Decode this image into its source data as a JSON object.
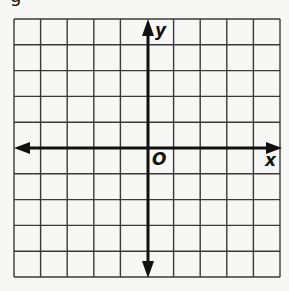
{
  "figure": {
    "x_axis_label": "x",
    "y_axis_label": "y",
    "origin_label": "O",
    "partial_top_left_glyph": "g",
    "grid": {
      "columns": 10,
      "rows": 10,
      "left": 14,
      "top": 19,
      "right": 280,
      "bottom": 277
    },
    "axis_position": {
      "x_axis_y": 148,
      "y_axis_x": 148
    },
    "colors": {
      "grid": "#3a3a3a",
      "axis": "#111111",
      "background": "#f7f7f5"
    }
  }
}
